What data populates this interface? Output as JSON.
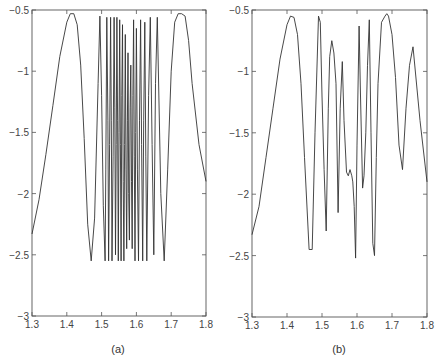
{
  "chart_data": [
    {
      "id": "a",
      "type": "line",
      "title": "",
      "caption": "(a)",
      "xlabel": "",
      "ylabel": "",
      "xlim": [
        1.3,
        1.8
      ],
      "ylim": [
        -3,
        -0.5
      ],
      "xticks": [
        1.3,
        1.4,
        1.5,
        1.6,
        1.7,
        1.8
      ],
      "xtick_labels": [
        "1.3",
        "1.4",
        "1.5",
        "1.6",
        "1.7",
        "1.8"
      ],
      "yticks": [
        -3,
        -2.5,
        -2,
        -1.5,
        -1,
        -0.5
      ],
      "ytick_labels": [
        "-3",
        "-2.5",
        "-2",
        "-1.5",
        "-1",
        "-0.5"
      ],
      "grid": false,
      "legend": null,
      "frame": {
        "left": 32,
        "top": 10,
        "right": 206,
        "bottom": 316
      },
      "series": [
        {
          "name": "chaotic trajectory (a)",
          "x": [
            1.3,
            1.32,
            1.34,
            1.36,
            1.38,
            1.4,
            1.41,
            1.42,
            1.43,
            1.44,
            1.45,
            1.46,
            1.47,
            1.48,
            1.49,
            1.495,
            1.5,
            1.505,
            1.51,
            1.512,
            1.515,
            1.518,
            1.52,
            1.523,
            1.526,
            1.528,
            1.53,
            1.533,
            1.536,
            1.538,
            1.54,
            1.542,
            1.544,
            1.546,
            1.548,
            1.55,
            1.552,
            1.554,
            1.556,
            1.558,
            1.56,
            1.562,
            1.564,
            1.566,
            1.568,
            1.57,
            1.572,
            1.574,
            1.576,
            1.578,
            1.58,
            1.582,
            1.584,
            1.586,
            1.588,
            1.59,
            1.592,
            1.594,
            1.596,
            1.598,
            1.6,
            1.603,
            1.606,
            1.609,
            1.612,
            1.615,
            1.618,
            1.621,
            1.624,
            1.627,
            1.63,
            1.635,
            1.64,
            1.645,
            1.65,
            1.655,
            1.66,
            1.67,
            1.68,
            1.69,
            1.7,
            1.71,
            1.72,
            1.73,
            1.74,
            1.75,
            1.76,
            1.78,
            1.8
          ],
          "y": [
            -2.33,
            -2.05,
            -1.68,
            -1.28,
            -0.88,
            -0.6,
            -0.53,
            -0.53,
            -0.62,
            -0.95,
            -1.55,
            -2.25,
            -2.55,
            -2.2,
            -1.1,
            -0.55,
            -1.2,
            -2.1,
            -2.55,
            -1.8,
            -0.56,
            -1.4,
            -2.55,
            -1.6,
            -0.56,
            -1.4,
            -2.55,
            -1.7,
            -0.56,
            -1.3,
            -2.5,
            -1.6,
            -0.56,
            -1.4,
            -2.55,
            -1.5,
            -0.58,
            -1.6,
            -2.55,
            -1.2,
            -0.62,
            -1.9,
            -2.55,
            -1.6,
            -0.7,
            -1.8,
            -2.45,
            -1.4,
            -0.85,
            -2.0,
            -2.38,
            -1.3,
            -0.95,
            -1.9,
            -2.45,
            -1.2,
            -0.58,
            -1.7,
            -2.55,
            -1.5,
            -0.65,
            -1.8,
            -2.55,
            -1.4,
            -0.58,
            -1.6,
            -2.55,
            -1.4,
            -0.6,
            -1.7,
            -2.55,
            -1.2,
            -0.56,
            -1.6,
            -2.5,
            -1.1,
            -0.56,
            -2.0,
            -2.55,
            -1.8,
            -1.0,
            -0.6,
            -0.53,
            -0.53,
            -0.55,
            -0.75,
            -1.1,
            -1.6,
            -1.9
          ]
        }
      ]
    },
    {
      "id": "b",
      "type": "line",
      "title": "",
      "caption": "(b)",
      "xlabel": "",
      "ylabel": "",
      "xlim": [
        1.3,
        1.8
      ],
      "ylim": [
        -3,
        -0.5
      ],
      "xticks": [
        1.3,
        1.4,
        1.5,
        1.6,
        1.7,
        1.8
      ],
      "xtick_labels": [
        "1.3",
        "1.4",
        "1.5",
        "1.6",
        "1.7",
        "1.8"
      ],
      "yticks": [
        -3,
        -2.5,
        -2,
        -1.5,
        -1,
        -0.5
      ],
      "ytick_labels": [
        "-3",
        "-2.5",
        "-2",
        "-1.5",
        "-1",
        "-0.5"
      ],
      "grid": false,
      "legend": null,
      "frame": {
        "left": 252,
        "top": 10,
        "right": 427,
        "bottom": 317
      },
      "series": [
        {
          "name": "sampled trajectory (b)",
          "x": [
            1.3,
            1.32,
            1.34,
            1.36,
            1.38,
            1.4,
            1.41,
            1.42,
            1.43,
            1.44,
            1.45,
            1.463,
            1.472,
            1.48,
            1.49,
            1.495,
            1.5,
            1.506,
            1.512,
            1.518,
            1.522,
            1.528,
            1.534,
            1.54,
            1.546,
            1.552,
            1.558,
            1.563,
            1.57,
            1.575,
            1.58,
            1.585,
            1.588,
            1.592,
            1.596,
            1.6,
            1.606,
            1.61,
            1.616,
            1.62,
            1.625,
            1.63,
            1.635,
            1.64,
            1.645,
            1.65,
            1.655,
            1.66,
            1.67,
            1.68,
            1.685,
            1.69,
            1.7,
            1.71,
            1.72,
            1.73,
            1.74,
            1.75,
            1.76,
            1.78,
            1.8
          ],
          "y": [
            -2.33,
            -2.1,
            -1.7,
            -1.3,
            -0.9,
            -0.62,
            -0.55,
            -0.56,
            -0.7,
            -1.1,
            -1.7,
            -2.45,
            -2.45,
            -1.5,
            -0.55,
            -0.6,
            -1.2,
            -1.8,
            -2.3,
            -1.3,
            -0.88,
            -0.75,
            -0.85,
            -1.1,
            -2.15,
            -1.3,
            -0.92,
            -1.4,
            -1.82,
            -1.85,
            -1.8,
            -1.85,
            -1.9,
            -2.1,
            -2.52,
            -1.6,
            -0.63,
            -1.2,
            -1.95,
            -1.85,
            -1.5,
            -0.95,
            -0.58,
            -1.5,
            -2.4,
            -2.5,
            -1.7,
            -1.1,
            -0.6,
            -0.55,
            -0.53,
            -0.55,
            -0.7,
            -1.05,
            -1.6,
            -1.8,
            -1.3,
            -0.95,
            -0.8,
            -1.4,
            -1.9
          ]
        }
      ]
    }
  ]
}
